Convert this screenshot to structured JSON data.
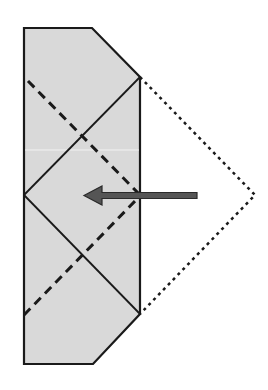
{
  "diagram": {
    "type": "origami-fold-step",
    "colors": {
      "background": "#ffffff",
      "paper_fill": "#d9d9d9",
      "outline": "#1a1a1a",
      "arrow_fill": "#555555",
      "arrow_stroke": "#2a2a2a"
    },
    "paper": {
      "points": [
        [
          24,
          28
        ],
        [
          92,
          28
        ],
        [
          140,
          77
        ],
        [
          140,
          314
        ],
        [
          93,
          364
        ],
        [
          24,
          364
        ]
      ]
    },
    "crease_solid": {
      "upper": [
        [
          24,
          195
        ],
        [
          140,
          77
        ]
      ],
      "lower": [
        [
          24,
          195
        ],
        [
          140,
          314
        ]
      ]
    },
    "crease_dashed": {
      "upper": [
        [
          28,
          81
        ],
        [
          140,
          195
        ]
      ],
      "lower": [
        [
          24,
          315
        ],
        [
          138,
          198
        ]
      ]
    },
    "flap_outline_dotted": {
      "points": [
        [
          140,
          77
        ],
        [
          255,
          195
        ],
        [
          140,
          314
        ]
      ]
    },
    "arrow": {
      "icon": "left-arrow-icon",
      "direction": "left",
      "tail_x": 197,
      "head_tip_x": 84,
      "y": 195
    }
  }
}
